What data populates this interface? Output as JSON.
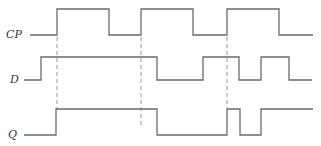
{
  "diagram": {
    "type": "timing-diagram",
    "signals": [
      {
        "name": "CP",
        "label": "CP",
        "initial": 0,
        "transitions": [
          57,
          109,
          141,
          193,
          227,
          279
        ],
        "start": 30,
        "end": 313
      },
      {
        "name": "D",
        "label": "D",
        "initial": 0,
        "transitions": [
          41,
          157,
          203,
          239,
          261,
          289
        ],
        "start": 24,
        "end": 312
      },
      {
        "name": "Q",
        "label": "Q",
        "initial": 0,
        "transitions": [
          56,
          157,
          227,
          240,
          261
        ],
        "start": 24,
        "end": 313
      }
    ],
    "clock_edge_markers": [
      57,
      141,
      227
    ],
    "line_color": "#6a6a6a"
  }
}
